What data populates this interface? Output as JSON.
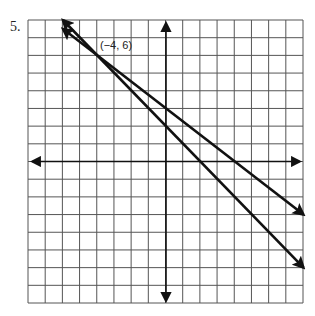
{
  "problem": {
    "number_label": "5."
  },
  "graph": {
    "grid": {
      "cols": 16,
      "rows": 16,
      "left": 28,
      "top": 20,
      "right": 303,
      "bottom": 303
    },
    "origin_px": {
      "x": 166,
      "y": 161.5
    },
    "x_range": [
      -8,
      8
    ],
    "y_range": [
      -8,
      8
    ],
    "colors": {
      "grid": "#555555",
      "axes": "#111111",
      "lines": "#111111",
      "background": "#ffffff"
    }
  },
  "annotation": {
    "point_label": "(−4, 6)",
    "point": {
      "x": -4,
      "y": 6
    }
  },
  "chart_data": {
    "type": "line",
    "title": "",
    "xlabel": "",
    "ylabel": "",
    "xlim": [
      -8,
      8
    ],
    "ylim": [
      -8,
      8
    ],
    "grid": true,
    "series": [
      {
        "name": "line-1",
        "points": [
          [
            -6,
            7.5
          ],
          [
            -4,
            6
          ],
          [
            8,
            -3
          ]
        ],
        "slope": -0.75
      },
      {
        "name": "line-2",
        "points": [
          [
            -6,
            8
          ],
          [
            -4,
            6
          ],
          [
            8,
            -6
          ]
        ],
        "slope": -1
      }
    ],
    "annotations": [
      {
        "text": "(−4, 6)",
        "x": -4,
        "y": 6
      }
    ]
  }
}
